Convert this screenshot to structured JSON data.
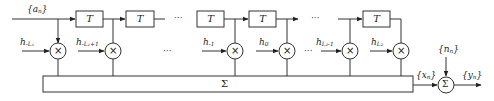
{
  "diagram": {
    "type": "transversal filter / ISI channel model",
    "input_label": "{a_n}",
    "input_label_main": "{a",
    "input_label_sub": "n",
    "input_label_close": "}",
    "delay_label": "T",
    "delay_blocks": [
      {
        "label": "T"
      },
      {
        "label": "T"
      },
      {
        "label": "T"
      },
      {
        "label": "T"
      },
      {
        "label": "T"
      }
    ],
    "ellipsis": "···",
    "taps": [
      {
        "main": "h",
        "sub": "-L₁"
      },
      {
        "main": "h",
        "sub": "-L₁+1"
      },
      {
        "main": "h",
        "sub": "-1"
      },
      {
        "main": "h",
        "sub": "0"
      },
      {
        "main": "h",
        "sub": "L₂-1"
      },
      {
        "main": "h",
        "sub": "L₂"
      }
    ],
    "multiplier_symbol": "×",
    "summation_label": "Σ",
    "sum_output_label": {
      "main": "{x",
      "sub": "n",
      "close": "}"
    },
    "noise_label": {
      "main": "{n",
      "sub": "n",
      "close": "}"
    },
    "adder_symbol": "Σ",
    "output_label": {
      "main": "{y",
      "sub": "n",
      "close": "}"
    }
  }
}
